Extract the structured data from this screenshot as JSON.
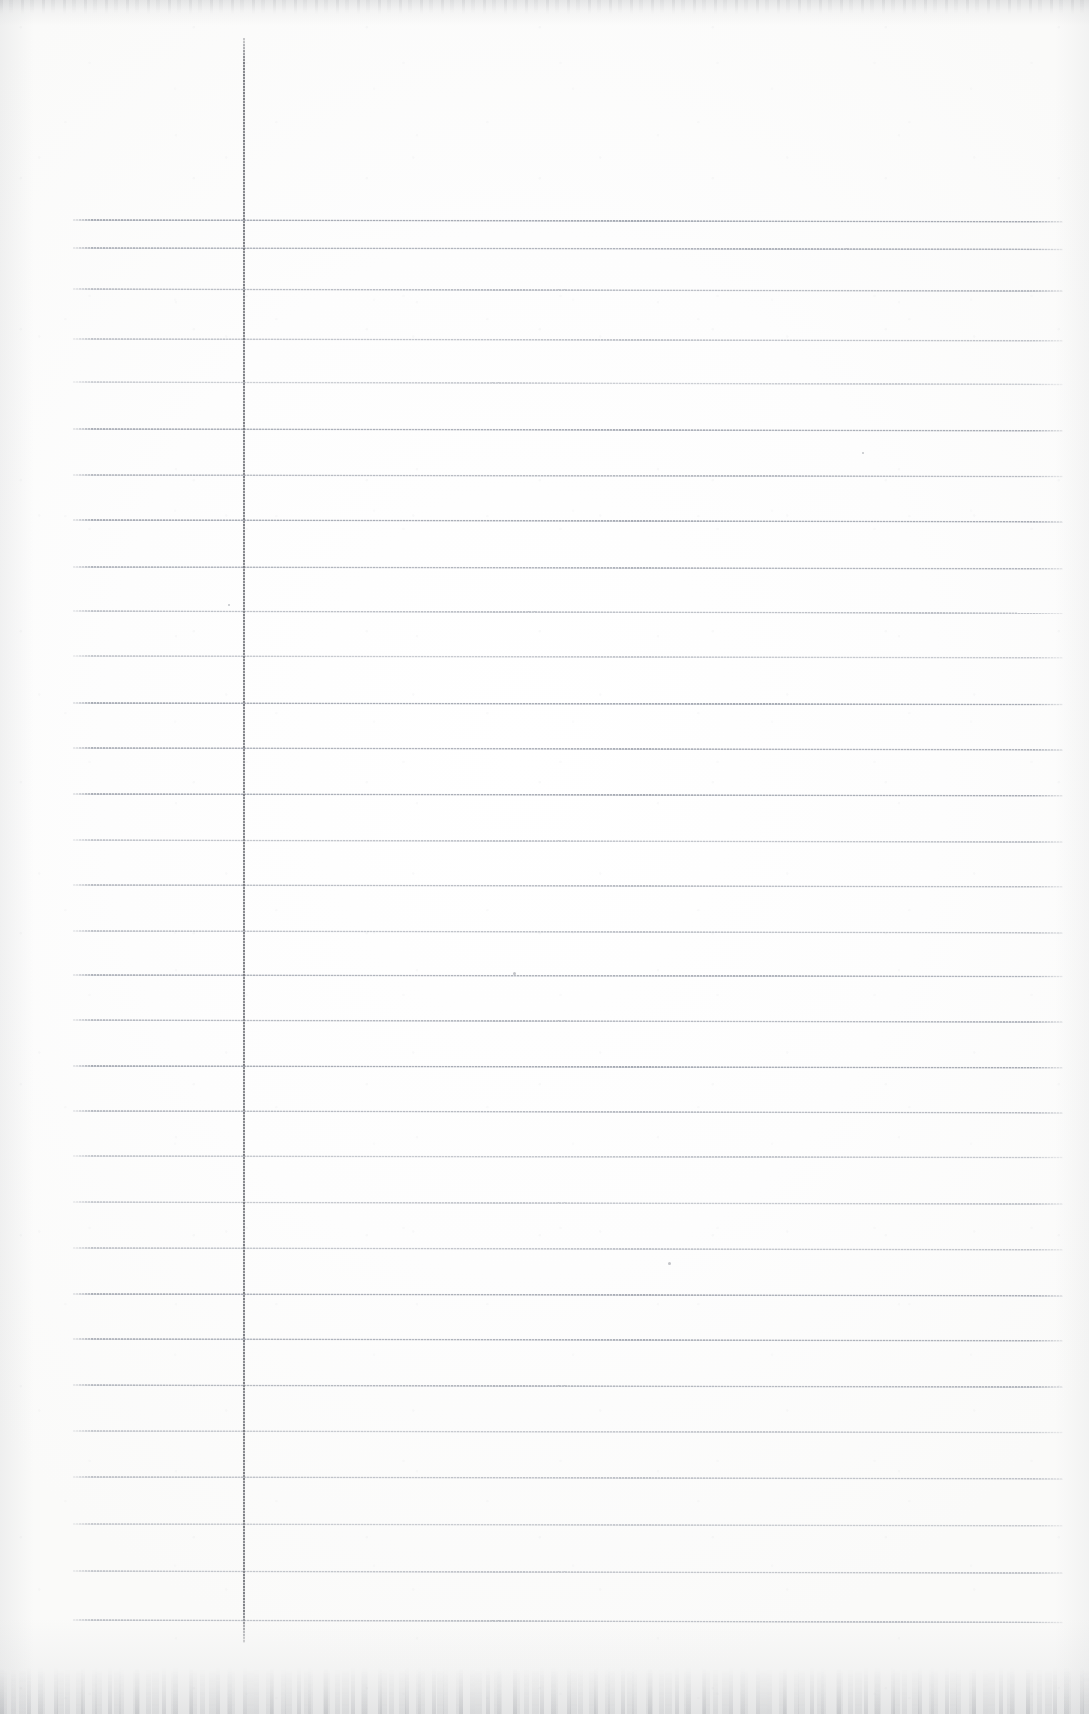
{
  "document": {
    "kind": "scanned-lined-notebook-page",
    "title": "Blank ruled notebook page",
    "page_width": 1089,
    "page_height": 1714,
    "text_content": "",
    "visible_text_blocks": []
  },
  "colors": {
    "paper": "#fdfdfd",
    "paper_shadow": "#fafaf9",
    "rule_line": "#9aa0ab",
    "margin_rule": "#78797f",
    "edge_fringe": "#b0b2b6"
  },
  "ruling": {
    "style": "college-ruled-horizontal",
    "line_count": 29,
    "first_line_y": 219,
    "line_spacing": 49.6,
    "line_left_x": 73,
    "line_right_x": 1063,
    "line_thickness": 2,
    "lines": [
      {
        "y": 219,
        "tilt": 0.1,
        "opacity": 0.9
      },
      {
        "y": 247,
        "tilt": 0.08,
        "opacity": 0.82
      },
      {
        "y": 288,
        "tilt": 0.12,
        "opacity": 0.7
      },
      {
        "y": 338,
        "tilt": 0.1,
        "opacity": 0.62
      },
      {
        "y": 381,
        "tilt": 0.14,
        "opacity": 0.52
      },
      {
        "y": 428,
        "tilt": 0.1,
        "opacity": 0.86
      },
      {
        "y": 474,
        "tilt": 0.09,
        "opacity": 0.72
      },
      {
        "y": 519,
        "tilt": 0.11,
        "opacity": 0.88
      },
      {
        "y": 566,
        "tilt": 0.1,
        "opacity": 0.8
      },
      {
        "y": 610,
        "tilt": 0.13,
        "opacity": 0.66
      },
      {
        "y": 655,
        "tilt": 0.1,
        "opacity": 0.58
      },
      {
        "y": 702,
        "tilt": 0.09,
        "opacity": 0.9
      },
      {
        "y": 747,
        "tilt": 0.11,
        "opacity": 0.84
      },
      {
        "y": 793,
        "tilt": 0.1,
        "opacity": 0.88
      },
      {
        "y": 839,
        "tilt": 0.12,
        "opacity": 0.62
      },
      {
        "y": 884,
        "tilt": 0.1,
        "opacity": 0.7
      },
      {
        "y": 930,
        "tilt": 0.11,
        "opacity": 0.64
      },
      {
        "y": 974,
        "tilt": 0.09,
        "opacity": 0.82
      },
      {
        "y": 1019,
        "tilt": 0.12,
        "opacity": 0.74
      },
      {
        "y": 1065,
        "tilt": 0.1,
        "opacity": 0.9
      },
      {
        "y": 1110,
        "tilt": 0.11,
        "opacity": 0.72
      },
      {
        "y": 1155,
        "tilt": 0.09,
        "opacity": 0.6
      },
      {
        "y": 1201,
        "tilt": 0.12,
        "opacity": 0.58
      },
      {
        "y": 1247,
        "tilt": 0.1,
        "opacity": 0.62
      },
      {
        "y": 1293,
        "tilt": 0.11,
        "opacity": 0.86
      },
      {
        "y": 1338,
        "tilt": 0.1,
        "opacity": 0.82
      },
      {
        "y": 1384,
        "tilt": 0.12,
        "opacity": 0.76
      },
      {
        "y": 1430,
        "tilt": 0.09,
        "opacity": 0.56
      },
      {
        "y": 1476,
        "tilt": 0.11,
        "opacity": 0.64
      },
      {
        "y": 1523,
        "tilt": 0.1,
        "opacity": 0.54
      },
      {
        "y": 1570,
        "tilt": 0.12,
        "opacity": 0.6
      },
      {
        "y": 1619,
        "tilt": 0.14,
        "opacity": 0.66
      }
    ]
  },
  "margin": {
    "style": "vertical-margin-rule",
    "x": 243,
    "top_y": 38,
    "bottom_y": 1643,
    "thickness": 2
  },
  "specks": [
    {
      "x": 513,
      "y": 972,
      "size": 3
    },
    {
      "x": 668,
      "y": 1262,
      "size": 3
    },
    {
      "x": 228,
      "y": 604,
      "size": 2
    },
    {
      "x": 862,
      "y": 452,
      "size": 2
    }
  ]
}
